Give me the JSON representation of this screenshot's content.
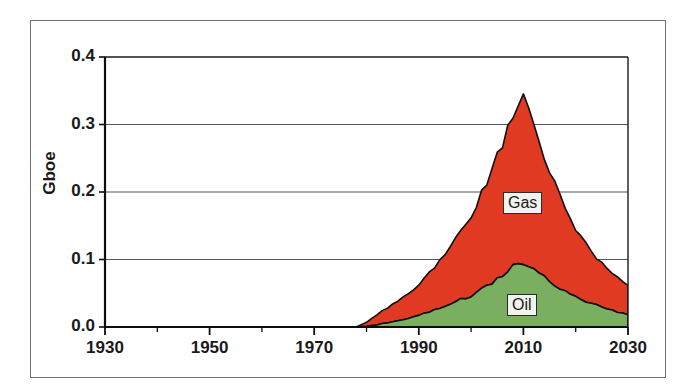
{
  "figure": {
    "frame_color": "#6e7073",
    "background": "#ffffff"
  },
  "chart_data": {
    "type": "area",
    "stacked": true,
    "title": "",
    "subtitle": "",
    "xlabel": "",
    "ylabel": "Gboe",
    "xlim": [
      1930,
      2030
    ],
    "ylim": [
      0.0,
      0.4
    ],
    "grid": true,
    "grid_axis": "y",
    "legend": "inline-labels",
    "x_tick_labels": [
      "1930",
      "1950",
      "1970",
      "1990",
      "2010",
      "2030"
    ],
    "x_major_ticks": [
      1930,
      1950,
      1970,
      1990,
      2010,
      2030
    ],
    "x_minor_tick_interval": 10,
    "y_tick_labels": [
      "0.0",
      "0.1",
      "0.2",
      "0.3",
      "0.4"
    ],
    "y_major_ticks": [
      0.0,
      0.1,
      0.2,
      0.3,
      0.4
    ],
    "series": [
      {
        "name": "Oil",
        "label": "Oil",
        "color": "#7aaf62",
        "stack_order": 1,
        "x": [
          1930,
          1940,
          1950,
          1960,
          1970,
          1978,
          1980,
          1981,
          1982,
          1983,
          1984,
          1985,
          1986,
          1987,
          1988,
          1989,
          1990,
          1991,
          1992,
          1993,
          1994,
          1995,
          1996,
          1997,
          1998,
          1999,
          2000,
          2001,
          2002,
          2003,
          2004,
          2005,
          2006,
          2007,
          2008,
          2009,
          2010,
          2011,
          2012,
          2013,
          2014,
          2015,
          2016,
          2018,
          2020,
          2022,
          2024,
          2026,
          2028,
          2030
        ],
        "values": [
          0.0,
          0.0,
          0.0,
          0.0,
          0.0,
          0.0,
          0.001,
          0.002,
          0.003,
          0.005,
          0.006,
          0.008,
          0.009,
          0.011,
          0.013,
          0.015,
          0.017,
          0.02,
          0.022,
          0.025,
          0.028,
          0.031,
          0.034,
          0.038,
          0.041,
          0.042,
          0.046,
          0.05,
          0.055,
          0.06,
          0.066,
          0.071,
          0.077,
          0.083,
          0.089,
          0.094,
          0.096,
          0.092,
          0.086,
          0.08,
          0.074,
          0.068,
          0.062,
          0.053,
          0.045,
          0.038,
          0.032,
          0.027,
          0.022,
          0.018
        ]
      },
      {
        "name": "Gas",
        "label": "Gas",
        "color": "#e03a22",
        "stack_order": 2,
        "x": [
          1930,
          1940,
          1950,
          1960,
          1970,
          1978,
          1980,
          1981,
          1982,
          1983,
          1984,
          1985,
          1986,
          1987,
          1988,
          1989,
          1990,
          1991,
          1992,
          1993,
          1994,
          1995,
          1996,
          1997,
          1998,
          1999,
          2000,
          2001,
          2002,
          2003,
          2004,
          2005,
          2006,
          2007,
          2008,
          2009,
          2010,
          2011,
          2012,
          2013,
          2014,
          2015,
          2016,
          2018,
          2020,
          2022,
          2024,
          2026,
          2028,
          2030
        ],
        "values": [
          0.0,
          0.0,
          0.0,
          0.0,
          0.0,
          0.0,
          0.006,
          0.011,
          0.015,
          0.019,
          0.022,
          0.026,
          0.03,
          0.034,
          0.037,
          0.041,
          0.046,
          0.052,
          0.058,
          0.064,
          0.07,
          0.078,
          0.086,
          0.095,
          0.1,
          0.107,
          0.118,
          0.13,
          0.142,
          0.155,
          0.168,
          0.181,
          0.195,
          0.21,
          0.225,
          0.238,
          0.249,
          0.232,
          0.213,
          0.196,
          0.18,
          0.164,
          0.149,
          0.123,
          0.101,
          0.084,
          0.07,
          0.059,
          0.05,
          0.042
        ]
      }
    ],
    "totals": {
      "name": "Oil + Gas total",
      "x": [
        1930,
        1940,
        1950,
        1960,
        1970,
        1978,
        1980,
        1982,
        1984,
        1986,
        1988,
        1990,
        1992,
        1994,
        1996,
        1998,
        2000,
        2002,
        2004,
        2006,
        2008,
        2010,
        2012,
        2014,
        2016,
        2018,
        2020,
        2022,
        2024,
        2026,
        2028,
        2030
      ],
      "values": [
        0.0,
        0.0,
        0.0,
        0.0,
        0.0,
        0.0,
        0.007,
        0.018,
        0.028,
        0.039,
        0.05,
        0.063,
        0.08,
        0.098,
        0.12,
        0.141,
        0.164,
        0.197,
        0.234,
        0.272,
        0.314,
        0.345,
        0.299,
        0.254,
        0.211,
        0.176,
        0.146,
        0.122,
        0.102,
        0.086,
        0.072,
        0.06
      ]
    },
    "annotations": [
      {
        "text": "Gas",
        "x": 2012,
        "y": 0.2
      },
      {
        "text": "Oil",
        "x": 2012,
        "y": 0.052
      }
    ],
    "notes": {
      "peak_year": 2010,
      "peak_total": 0.345,
      "peak_oil": 0.096,
      "series_start_year": 1980
    }
  }
}
